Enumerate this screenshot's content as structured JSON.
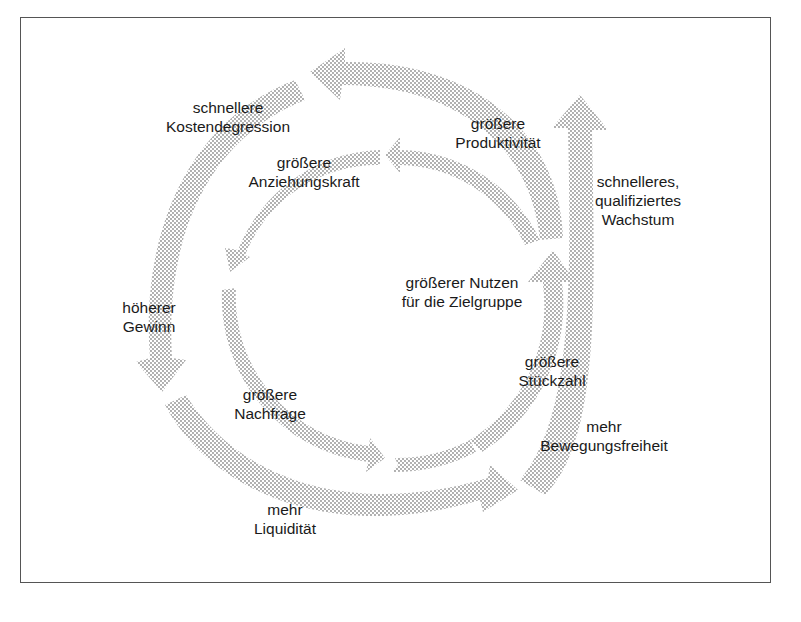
{
  "diagram": {
    "type": "cycle",
    "fill_color": "#9a9a9a",
    "outer_cycle": [
      {
        "id": "growth",
        "text": "schnelleres,\nqualifiziertes\nWachstum"
      },
      {
        "id": "productivity",
        "text": "größere\nProduktivität"
      },
      {
        "id": "cost",
        "text": "schnellere\nKostendegression"
      },
      {
        "id": "profit",
        "text": "höherer\nGewinn"
      },
      {
        "id": "liquidity",
        "text": "mehr\nLiquidität"
      },
      {
        "id": "freedom",
        "text": "mehr\nBewegungsfreiheit"
      }
    ],
    "inner_cycle": [
      {
        "id": "attraction",
        "text": "größere\nAnziehungskraft"
      },
      {
        "id": "demand",
        "text": "größere\nNachfrage"
      },
      {
        "id": "quantity",
        "text": "größere\nStückzahl"
      }
    ],
    "center": {
      "text": "größerer Nutzen\nfür die Zielgruppe"
    }
  }
}
